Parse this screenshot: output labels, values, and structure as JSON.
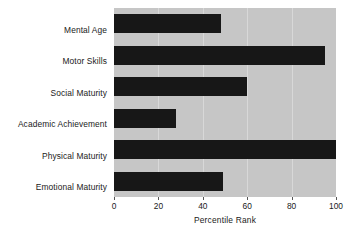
{
  "chart_data": {
    "type": "bar",
    "orientation": "horizontal",
    "title": "",
    "xlabel": "Percentile Rank",
    "ylabel": "",
    "categories": [
      "Mental Age",
      "Motor Skills",
      "Social Maturity",
      "Academic Achievement",
      "Physical Maturity",
      "Emotional Maturity"
    ],
    "values": [
      48,
      95,
      60,
      28,
      100,
      49
    ],
    "xlim": [
      0,
      100
    ],
    "xticks": [
      0,
      20,
      40,
      60,
      80,
      100
    ],
    "xtick_labels": [
      "0",
      "20",
      "40",
      "60",
      "80",
      "100"
    ],
    "grid": true,
    "grid_axis": "x",
    "legend": false,
    "colors": {
      "bar": "#171717",
      "plot_background": "#c6c6c6",
      "gridline": "#d8d8d8",
      "figure_background": "#ffffff",
      "text": "#1a1a1a"
    }
  }
}
